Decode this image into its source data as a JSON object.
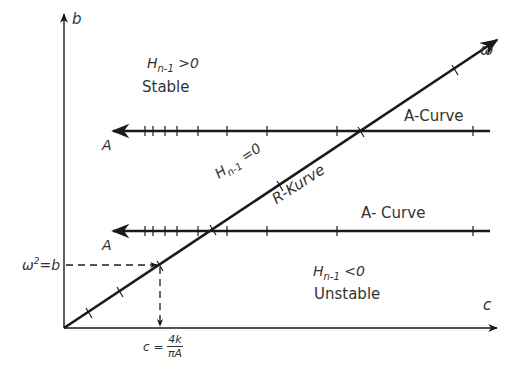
{
  "axes": {
    "y_label": "b",
    "x_label": "c",
    "r_curve_end_label": "ω"
  },
  "regions": {
    "stable": {
      "condition_var": "H",
      "condition_sub": "n-1",
      "condition_rel": " >0",
      "label": "Stable"
    },
    "unstable": {
      "condition_var": "H",
      "condition_sub": "n-1",
      "condition_rel": " <0",
      "label": "Unstable"
    },
    "boundary": {
      "condition_var": "H",
      "condition_sub": "n-1",
      "condition_rel": " =0",
      "label": "R-Kurve"
    }
  },
  "curves": {
    "upper_a": {
      "label": "A-Curve",
      "arrow_label": "A"
    },
    "lower_a": {
      "label": "A- Curve",
      "arrow_label": "A"
    }
  },
  "intersection": {
    "y_label_base": "ω",
    "y_label_exp": "2",
    "y_label_rest": "=b",
    "x_label_prefix": "c =",
    "x_label_num": "4k",
    "x_label_den": "πA"
  },
  "colors": {
    "line": "#1a1a1a",
    "text": "#333333",
    "background": "#ffffff"
  }
}
